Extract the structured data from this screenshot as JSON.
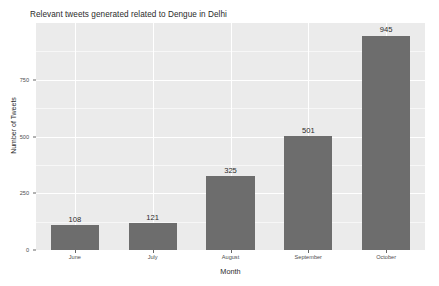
{
  "chart_data": {
    "type": "bar",
    "title": "Relevant tweets generated related to Dengue in Delhi",
    "xlabel": "Month",
    "ylabel": "Number of Tweets",
    "categories": [
      "June",
      "July",
      "August",
      "September",
      "October"
    ],
    "values": [
      108,
      121,
      325,
      501,
      945
    ],
    "value_labels": [
      "108",
      "121",
      "325",
      "501",
      "945"
    ],
    "ylim": [
      0,
      1000
    ],
    "yticks": [
      0,
      250,
      500,
      750
    ],
    "ytick_labels": [
      "0",
      "250",
      "500",
      "750"
    ],
    "grid": "horizontal-and-vertical-white-on-gray-panel",
    "legend": "none",
    "bar_color": "#6d6d6d",
    "panel_color": "#ebebeb",
    "gridline_color": "#ffffff",
    "text_color": "#2b2b2b",
    "tick_color": "#4d4d4d"
  }
}
